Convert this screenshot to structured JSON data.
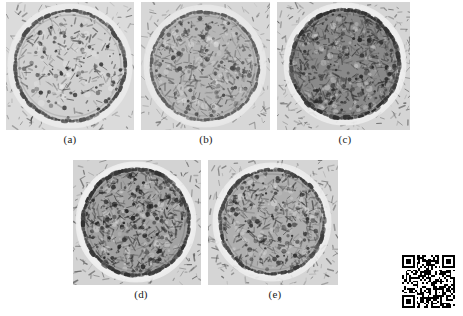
{
  "figure": {
    "kind": "micrograph-panel-figure",
    "background_color": "#ffffff",
    "panel_count": 5,
    "rows": [
      3,
      2
    ],
    "panels": [
      {
        "id": "a",
        "caption": "(a)",
        "x": 6,
        "y": 2,
        "width": 128,
        "height": 128,
        "caption_x": 40,
        "caption_y": 133,
        "caption_width": 60,
        "description": "circular vesicle cross-section, light interior, dark thin membrane ring, speckled granular background",
        "interior_tone": "#d7d7d7",
        "background_tone": "#e3e3e3",
        "ring_tone": "#4a4a4a",
        "halo_tone": "#f2f2f2",
        "circle_cx": 64,
        "circle_cy": 64,
        "circle_r": 55,
        "ring_width": 3.0,
        "speckle_density": 0.34,
        "speckle_dark": "#3b3b3b",
        "interior_speckle_density": 0.26,
        "seed": 101
      },
      {
        "id": "b",
        "caption": "(b)",
        "x": 141,
        "y": 2,
        "width": 129,
        "height": 128,
        "caption_x": 176,
        "caption_y": 133,
        "caption_width": 60,
        "description": "circular vesicle cross-section, mid-gray mottled interior, soft membrane ring",
        "interior_tone": "#bcbcbc",
        "background_tone": "#dedede",
        "ring_tone": "#5d5d5d",
        "halo_tone": "#f0f0f0",
        "circle_cx": 64,
        "circle_cy": 64,
        "circle_r": 54,
        "ring_width": 2.6,
        "speckle_density": 0.4,
        "speckle_dark": "#4a4a4a",
        "interior_speckle_density": 0.46,
        "seed": 202
      },
      {
        "id": "c",
        "caption": "(c)",
        "x": 277,
        "y": 2,
        "width": 133,
        "height": 128,
        "caption_x": 315,
        "caption_y": 133,
        "caption_width": 60,
        "description": "circular vesicle cross-section, dark dense interior, strong dark membrane ring, bright halo lower-left",
        "interior_tone": "#8e8e8e",
        "background_tone": "#dcdcdc",
        "ring_tone": "#2f2f2f",
        "halo_tone": "#f6f6f6",
        "circle_cx": 68,
        "circle_cy": 62,
        "circle_r": 54,
        "ring_width": 3.4,
        "speckle_density": 0.44,
        "speckle_dark": "#2b2b2b",
        "interior_speckle_density": 0.58,
        "seed": 303
      },
      {
        "id": "d",
        "caption": "(d)",
        "x": 73,
        "y": 160,
        "width": 128,
        "height": 125,
        "caption_x": 111,
        "caption_y": 288,
        "caption_width": 60,
        "description": "circular vesicle cross-section, coarse dark granular interior, thick dark ring, bright halo",
        "interior_tone": "#a8a8a8",
        "background_tone": "#dadada",
        "ring_tone": "#333333",
        "halo_tone": "#f7f7f7",
        "circle_cx": 63,
        "circle_cy": 62,
        "circle_r": 53,
        "ring_width": 3.2,
        "speckle_density": 0.42,
        "speckle_dark": "#262626",
        "interior_speckle_density": 0.6,
        "seed": 404
      },
      {
        "id": "e",
        "caption": "(e)",
        "x": 208,
        "y": 160,
        "width": 130,
        "height": 125,
        "caption_x": 245,
        "caption_y": 288,
        "caption_width": 60,
        "description": "circular vesicle cross-section, medium granular interior, dark ring with bright outer halo",
        "interior_tone": "#b5b5b5",
        "background_tone": "#dcdcdc",
        "ring_tone": "#3d3d3d",
        "halo_tone": "#f6f6f6",
        "circle_cx": 64,
        "circle_cy": 62,
        "circle_r": 52,
        "ring_width": 2.9,
        "speckle_density": 0.4,
        "speckle_dark": "#303030",
        "interior_speckle_density": 0.5,
        "seed": 505
      }
    ]
  },
  "watermark": {
    "type": "qr-code",
    "label": "qr-code",
    "x": 402,
    "y": 255,
    "size": 53,
    "modules": 29,
    "foreground_color": "#000000",
    "background_color": "#ffffff"
  }
}
